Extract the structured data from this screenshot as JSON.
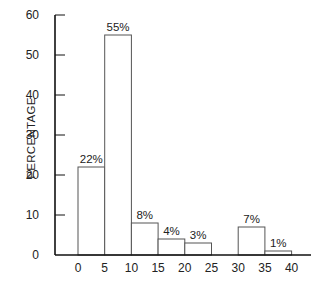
{
  "chart_data": {
    "type": "bar",
    "title": "",
    "xlabel": "",
    "ylabel": "PERCENTAGE",
    "ylim": [
      0,
      60
    ],
    "xlim": [
      0,
      40
    ],
    "grid": false,
    "legend": null,
    "y_ticks": [
      0,
      10,
      20,
      30,
      40,
      50,
      60
    ],
    "x_ticks": [
      0,
      5,
      10,
      15,
      20,
      25,
      30,
      35,
      40
    ],
    "bins": [
      {
        "from": 0,
        "to": 5,
        "value": 22,
        "label": "22%"
      },
      {
        "from": 5,
        "to": 10,
        "value": 55,
        "label": "55%"
      },
      {
        "from": 10,
        "to": 15,
        "value": 8,
        "label": "8%"
      },
      {
        "from": 15,
        "to": 20,
        "value": 4,
        "label": "4%"
      },
      {
        "from": 20,
        "to": 25,
        "value": 3,
        "label": "3%"
      },
      {
        "from": 25,
        "to": 30,
        "value": 0,
        "label": ""
      },
      {
        "from": 30,
        "to": 35,
        "value": 7,
        "label": "7%"
      },
      {
        "from": 35,
        "to": 40,
        "value": 1,
        "label": "1%"
      }
    ],
    "categories": [
      "0-5",
      "5-10",
      "10-15",
      "15-20",
      "20-25",
      "25-30",
      "30-35",
      "35-40"
    ],
    "values": [
      22,
      55,
      8,
      4,
      3,
      0,
      7,
      1
    ]
  },
  "colors": {
    "bar_fill": "#ffffff",
    "bar_stroke": "#555555",
    "axis": "#111111"
  }
}
